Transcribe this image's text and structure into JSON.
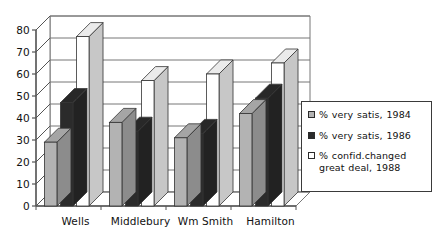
{
  "chart_data": {
    "type": "bar",
    "title": "",
    "xlabel": "",
    "ylabel": "",
    "ylim": [
      0,
      80
    ],
    "ytick_step": 10,
    "yticks": [
      0,
      10,
      20,
      30,
      40,
      50,
      60,
      70,
      80
    ],
    "grid": true,
    "grid_axis": "y",
    "three_d": true,
    "legend_position": "right",
    "categories": [
      "Wells",
      "Middlebury",
      "Wm Smith",
      "Hamilton"
    ],
    "series": [
      {
        "name": "% very satis, 1984",
        "color": "#b3b3b3",
        "values": [
          29,
          38,
          31,
          42
        ]
      },
      {
        "name": "% very satis, 1986",
        "color": "#2b2b2b",
        "values": [
          47,
          34,
          33,
          49
        ]
      },
      {
        "name": "% confid.changed great deal, 1988",
        "color": "#ffffff",
        "values": [
          77,
          57,
          60,
          65
        ]
      }
    ]
  },
  "legend": {
    "entries": [
      {
        "label": "% very satis, 1984",
        "swatch": "light-gray-swatch"
      },
      {
        "label": "% very satis, 1986",
        "swatch": "dark-swatch"
      },
      {
        "label": "% confid.changed great deal, 1988",
        "swatch": "white-swatch"
      }
    ]
  },
  "axes": {
    "y_tick_labels": [
      "80",
      "70",
      "60",
      "50",
      "40",
      "30",
      "20",
      "10",
      "0"
    ],
    "x_tick_labels": [
      "Wells",
      "Middlebury",
      "Wm Smith",
      "Hamilton"
    ]
  },
  "colors": {
    "series_1": "#b3b3b3",
    "series_2": "#2b2b2b",
    "series_3": "#ffffff",
    "axis": "#555555",
    "grid": "#777777",
    "text": "#111111"
  }
}
